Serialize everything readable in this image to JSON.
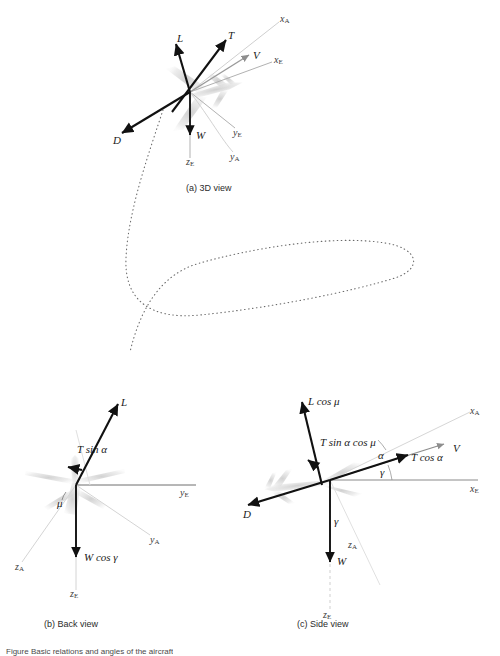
{
  "figure": {
    "caption": "Figure  Basic relations and angles of the aircraft",
    "panels": [
      {
        "id": "a",
        "caption": "(a) 3D view"
      },
      {
        "id": "b",
        "caption": "(b) Back view"
      },
      {
        "id": "c",
        "caption": "(c) Side view"
      }
    ]
  },
  "colors": {
    "vector": "#111111",
    "axis": "#8e8e8e",
    "axis_dark": "#6f6f6f",
    "trajectory": "#555555",
    "aircraft": "#c9c9c9",
    "background": "#ffffff"
  },
  "panel_a": {
    "name": "3D view",
    "caption": "(a) 3D view",
    "forces": [
      {
        "symbol": "L",
        "name": "lift"
      },
      {
        "symbol": "T",
        "name": "thrust"
      },
      {
        "symbol": "D",
        "name": "drag"
      },
      {
        "symbol": "W",
        "name": "weight"
      },
      {
        "symbol": "V",
        "name": "velocity"
      }
    ],
    "axes": [
      {
        "symbol": "x",
        "subscript": "A"
      },
      {
        "symbol": "x",
        "subscript": "E"
      },
      {
        "symbol": "y",
        "subscript": "E"
      },
      {
        "symbol": "y",
        "subscript": "A"
      },
      {
        "symbol": "z",
        "subscript": "E"
      }
    ]
  },
  "panel_b": {
    "name": "Back view",
    "caption": "(b) Back view",
    "forces": [
      {
        "symbol": "L",
        "name": "lift"
      },
      {
        "symbol": "T sin α",
        "name": "thrust-vertical-component"
      },
      {
        "symbol": "W cos γ",
        "name": "weight-component"
      }
    ],
    "angles": [
      {
        "symbol": "μ",
        "name": "bank-angle"
      }
    ],
    "axes": [
      {
        "symbol": "y",
        "subscript": "E"
      },
      {
        "symbol": "y",
        "subscript": "A"
      },
      {
        "symbol": "z",
        "subscript": "A"
      },
      {
        "symbol": "z",
        "subscript": "E"
      }
    ]
  },
  "panel_c": {
    "name": "Side view",
    "caption": "(c) Side view",
    "forces": [
      {
        "symbol": "L cos μ",
        "name": "lift-component"
      },
      {
        "symbol": "T sin α cos μ",
        "name": "thrust-normal-component"
      },
      {
        "symbol": "T cos α",
        "name": "thrust-axial-component"
      },
      {
        "symbol": "D",
        "name": "drag"
      },
      {
        "symbol": "W",
        "name": "weight"
      },
      {
        "symbol": "V",
        "name": "velocity"
      }
    ],
    "angles": [
      {
        "symbol": "α",
        "name": "angle-of-attack"
      },
      {
        "symbol": "γ",
        "name": "flight-path-angle"
      }
    ],
    "axes": [
      {
        "symbol": "x",
        "subscript": "A"
      },
      {
        "symbol": "x",
        "subscript": "E"
      },
      {
        "symbol": "z",
        "subscript": "A"
      },
      {
        "symbol": "z",
        "subscript": "E"
      }
    ]
  },
  "trajectory": {
    "name": "flight-path",
    "style": "dotted-loop"
  }
}
